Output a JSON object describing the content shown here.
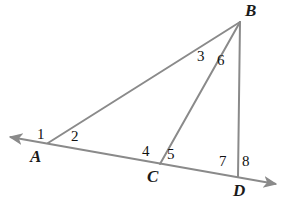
{
  "figure": {
    "type": "geometry-diagram",
    "background_color": "#ffffff",
    "line_color": "#8a8a8a",
    "label_color": "#1a1a1a",
    "stroke_width": 2
  },
  "points": {
    "A": {
      "label": "A",
      "x": 48,
      "y": 143,
      "label_x": 30,
      "label_y": 148
    },
    "B": {
      "label": "B",
      "x": 240,
      "y": 22,
      "label_x": 245,
      "label_y": 2
    },
    "C": {
      "label": "C",
      "x": 160,
      "y": 164,
      "label_x": 147,
      "label_y": 168
    },
    "D": {
      "label": "D",
      "x": 238,
      "y": 177,
      "label_x": 233,
      "label_y": 182
    }
  },
  "segments": [
    {
      "name": "ray-transversal-AD",
      "from": "arrow-left",
      "to": "arrow-right",
      "x1": 10,
      "y1": 137,
      "x2": 276,
      "y2": 184,
      "arrow_start": true,
      "arrow_end": true
    },
    {
      "name": "segment-AB",
      "x1": 48,
      "y1": 143,
      "x2": 240,
      "y2": 22,
      "arrow_start": false,
      "arrow_end": false
    },
    {
      "name": "segment-BC",
      "x1": 240,
      "y1": 22,
      "x2": 160,
      "y2": 164,
      "arrow_start": false,
      "arrow_end": false
    },
    {
      "name": "segment-BD",
      "x1": 240,
      "y1": 22,
      "x2": 238,
      "y2": 177,
      "arrow_start": false,
      "arrow_end": false
    }
  ],
  "angle_labels": [
    {
      "id": "1",
      "text": "1",
      "at_vertex": "A",
      "x": 37,
      "y": 127
    },
    {
      "id": "2",
      "text": "2",
      "at_vertex": "A",
      "x": 71,
      "y": 129
    },
    {
      "id": "3",
      "text": "3",
      "at_vertex": "B",
      "x": 197,
      "y": 49
    },
    {
      "id": "4",
      "text": "4",
      "at_vertex": "C",
      "x": 142,
      "y": 144
    },
    {
      "id": "5",
      "text": "5",
      "at_vertex": "C",
      "x": 167,
      "y": 147
    },
    {
      "id": "6",
      "text": "6",
      "at_vertex": "B",
      "x": 217,
      "y": 53
    },
    {
      "id": "7",
      "text": "7",
      "at_vertex": "D",
      "x": 219,
      "y": 154
    },
    {
      "id": "8",
      "text": "8",
      "at_vertex": "D",
      "x": 242,
      "y": 154
    }
  ]
}
